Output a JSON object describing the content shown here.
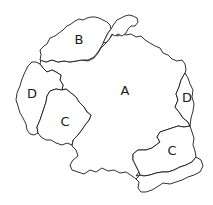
{
  "diagram": {
    "type": "region-map",
    "stroke_color": "#1a1a1a",
    "background": "#ffffff",
    "regions": [
      {
        "id": "A",
        "label": "A",
        "x": 125,
        "y": 91
      },
      {
        "id": "B",
        "label": "B",
        "x": 79,
        "y": 40
      },
      {
        "id": "C1",
        "label": "C",
        "x": 65,
        "y": 122
      },
      {
        "id": "C2",
        "label": "C",
        "x": 172,
        "y": 151
      },
      {
        "id": "D1",
        "label": "D",
        "x": 32,
        "y": 94
      },
      {
        "id": "D2",
        "label": "D",
        "x": 187,
        "y": 98
      }
    ]
  }
}
